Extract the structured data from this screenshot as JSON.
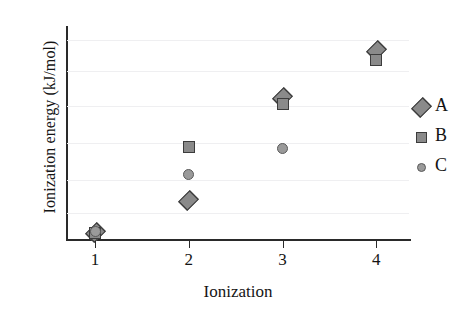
{
  "chart_data": {
    "type": "scatter",
    "title": "",
    "xlabel": "Ionization",
    "ylabel": "Ionization energy (kJ/mol)",
    "x": [
      1,
      2,
      3,
      4
    ],
    "xticklabels": [
      "1",
      "2",
      "3",
      "4"
    ],
    "xlim": [
      0.7,
      4.35
    ],
    "ylim": [
      0,
      6
    ],
    "yticklabels": [],
    "grid": "horizontal",
    "legend_position": "right",
    "series": [
      {
        "name": "A",
        "marker": "diamond",
        "color": "#8a8a8a",
        "edge_color": "#3c3c3c",
        "x": [
          1,
          2,
          3,
          4
        ],
        "values": [
          0.22,
          1.12,
          4.0,
          5.32
        ]
      },
      {
        "name": "B",
        "marker": "square",
        "color": "#8a8a8a",
        "edge_color": "#3c3c3c",
        "x": [
          1,
          2,
          3,
          4
        ],
        "values": [
          0.2,
          2.6,
          3.82,
          5.05
        ]
      },
      {
        "name": "C",
        "marker": "circle",
        "color": "#9a9a9a",
        "edge_color": "#5a5a5a",
        "x": [
          1,
          2,
          3
        ],
        "values": [
          0.25,
          1.84,
          2.57
        ]
      }
    ],
    "gridlines_y": [
      5.62,
      4.75,
      3.75,
      2.72,
      1.69,
      0.77
    ]
  },
  "legend": {
    "entries": [
      {
        "label": "A",
        "marker": "diamond"
      },
      {
        "label": "B",
        "marker": "square"
      },
      {
        "label": "C",
        "marker": "circle"
      }
    ]
  }
}
